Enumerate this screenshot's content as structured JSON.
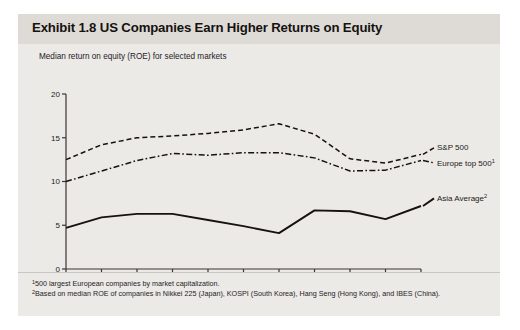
{
  "exhibit": {
    "title": "Exhibit 1.8 US Companies Earn Higher Returns on Equity",
    "subtitle": "Median return on equity (ROE) for selected markets",
    "footnotes": [
      {
        "marker": "1",
        "text": "500 largest European companies by market capitalization."
      },
      {
        "marker": "2",
        "text": "Based on median ROE of companies in Nikkei 225 (Japan), KOSPI (South Korea), Hang Seng (Hong Kong), and IBES (China)."
      }
    ],
    "colors": {
      "panel": "#eceae7",
      "title_band": "#dedbd7",
      "ink": "#16120f",
      "axis": "#3a3532",
      "line": "#17120f"
    }
  },
  "chart_data": {
    "type": "line",
    "title": "Median return on equity (ROE) for selected markets",
    "xlabel": "",
    "ylabel": "",
    "x": [
      1993,
      1994,
      1995,
      1996,
      1997,
      1998,
      1999,
      2000,
      2001,
      2002,
      2003
    ],
    "tick_labels": [
      "1993",
      "",
      "1995",
      "",
      "1997",
      "",
      "1999",
      "",
      "2001",
      "",
      "2003"
    ],
    "yticks": [
      0,
      5,
      10,
      15,
      20
    ],
    "ylim": [
      0,
      20
    ],
    "xlim": [
      1993,
      2003
    ],
    "grid": false,
    "legend_position": "right-inline",
    "series": [
      {
        "name": "S&P 500",
        "label": "S&P 500",
        "marker": "",
        "style": "dashed",
        "values": [
          12.5,
          14.2,
          15.0,
          15.2,
          15.5,
          15.9,
          16.6,
          15.4,
          12.6,
          12.1,
          13.1
        ]
      },
      {
        "name": "Europe top 500",
        "label": "Europe top 500",
        "marker": "1",
        "style": "dash-dot",
        "values": [
          10.0,
          11.2,
          12.4,
          13.2,
          13.0,
          13.3,
          13.3,
          12.7,
          11.2,
          11.3,
          12.4
        ]
      },
      {
        "name": "Asia Average",
        "label": "Asia Average",
        "marker": "2",
        "style": "solid",
        "values": [
          4.7,
          5.9,
          6.3,
          6.3,
          5.6,
          4.9,
          4.1,
          6.7,
          6.6,
          5.7,
          7.2
        ]
      }
    ]
  }
}
